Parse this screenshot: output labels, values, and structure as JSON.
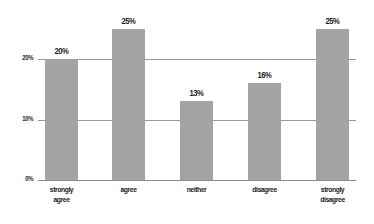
{
  "chart_data": {
    "type": "bar",
    "title": "",
    "xlabel": "",
    "ylabel": "",
    "categories": [
      "strongly agree",
      "agree",
      "neither",
      "disagree",
      "strongly disagree"
    ],
    "category_lines": [
      [
        "strongly",
        "agree"
      ],
      [
        "agree"
      ],
      [
        "neither"
      ],
      [
        "disagree"
      ],
      [
        "strongly",
        "disagree"
      ]
    ],
    "values": [
      20,
      25,
      13,
      16,
      25
    ],
    "value_labels": [
      "20%",
      "25%",
      "13%",
      "16%",
      "25%"
    ],
    "ylim": [
      0,
      25
    ],
    "yticks": [
      0,
      10,
      20
    ],
    "ytick_labels": [
      "0%",
      "10%",
      "20%"
    ],
    "grid": true,
    "legend": null,
    "bar_color": "#a4a4a4",
    "grid_color": "#9a9a9a"
  }
}
